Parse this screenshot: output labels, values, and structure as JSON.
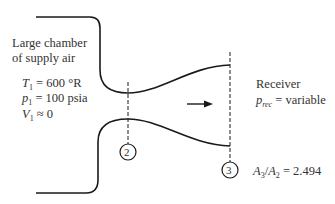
{
  "chamber": {
    "title_line1": "Large chamber",
    "title_line2": "of supply air",
    "T1": {
      "symbol": "T",
      "sub": "1",
      "eq": " = 600 °R"
    },
    "p1": {
      "symbol": "p",
      "sub": "1",
      "eq": " = 100 psia"
    },
    "V1": {
      "symbol": "V",
      "sub": "1",
      "eq": " ≈ 0"
    }
  },
  "receiver": {
    "title": "Receiver",
    "p_rec": {
      "symbol": "p",
      "sub": "rec",
      "eq": " = variable"
    }
  },
  "stations": {
    "throat": "2",
    "exit": "3"
  },
  "area_ratio": {
    "num_symbol": "A",
    "num_sub": "3",
    "slash": "/",
    "den_symbol": "A",
    "den_sub": "2",
    "eq": " = 2.494"
  },
  "flow_direction": "right-arrow",
  "colors": {
    "line": "#1a1a1a",
    "text": "#333333",
    "background": "#ffffff"
  }
}
